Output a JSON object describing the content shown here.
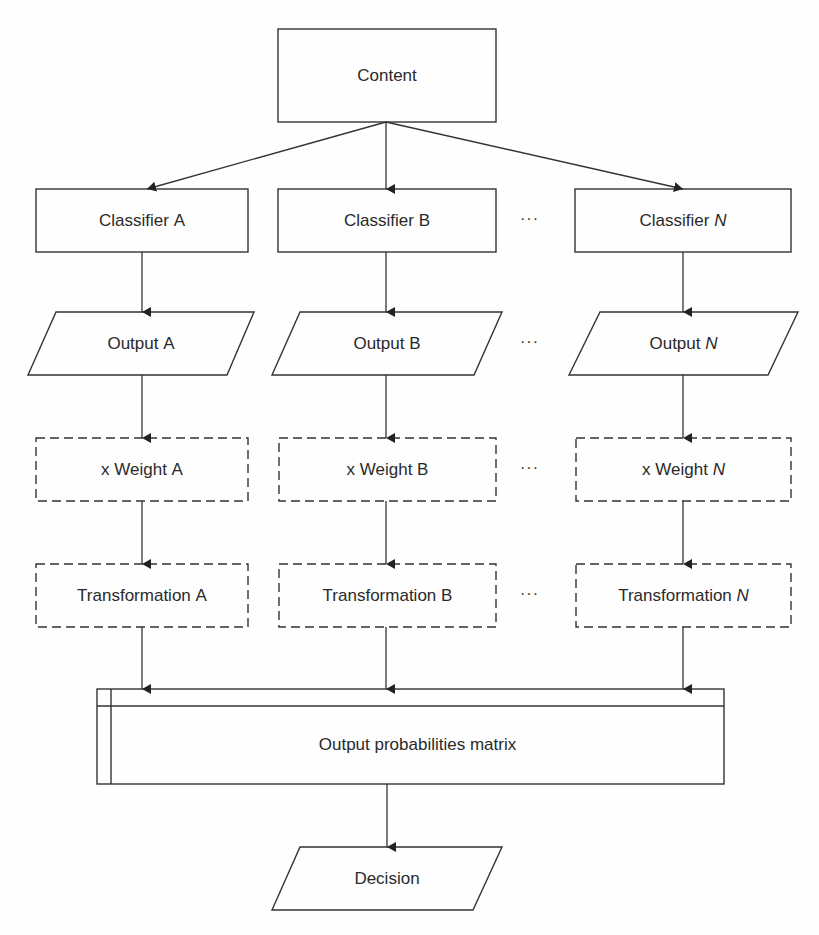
{
  "diagram": {
    "root": {
      "label": "Content"
    },
    "columns": [
      {
        "id": "A",
        "classifier": {
          "prefix": "Classifier ",
          "var": "A",
          "italic": false
        },
        "output": {
          "prefix": "Output ",
          "var": "A",
          "italic": false
        },
        "weight": {
          "prefix": "x Weight ",
          "var": "A",
          "italic": false
        },
        "transformation": {
          "prefix": "Transformation ",
          "var": "A",
          "italic": false
        }
      },
      {
        "id": "B",
        "classifier": {
          "prefix": "Classifier ",
          "var": "B",
          "italic": false
        },
        "output": {
          "prefix": "Output ",
          "var": "B",
          "italic": false
        },
        "weight": {
          "prefix": "x Weight ",
          "var": "B",
          "italic": false
        },
        "transformation": {
          "prefix": "Transformation ",
          "var": "B",
          "italic": false
        }
      },
      {
        "id": "N",
        "classifier": {
          "prefix": "Classifier ",
          "var": "N",
          "italic": true
        },
        "output": {
          "prefix": "Output ",
          "var": "N",
          "italic": true
        },
        "weight": {
          "prefix": "x Weight ",
          "var": "N",
          "italic": true
        },
        "transformation": {
          "prefix": "Transformation ",
          "var": "N",
          "italic": true
        }
      }
    ],
    "ellipsis": "···",
    "matrix": {
      "label": "Output probabilities matrix"
    },
    "decision": {
      "label": "Decision"
    },
    "colors": {
      "stroke": "#333333",
      "text": "#2a2a2a",
      "background": "#fefefe"
    }
  }
}
